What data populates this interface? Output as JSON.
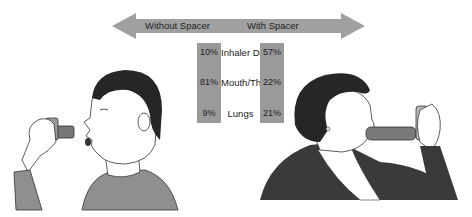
{
  "arrows": {
    "left_label": "Without Spacer",
    "right_label": "With Spacer",
    "color": "#a0a0a0"
  },
  "table": {
    "rows": [
      {
        "label": "Inhaler Device",
        "without_spacer": "10%",
        "with_spacer": "57%"
      },
      {
        "label": "Mouth/Throat",
        "without_spacer": "81%",
        "with_spacer": "22%"
      },
      {
        "label": "Lungs",
        "without_spacer": "9%",
        "with_spacer": "21%"
      }
    ],
    "bar_color": "#9a9a9a"
  },
  "illustrations": {
    "left": "boy using inhaler without spacer",
    "right": "woman using inhaler with spacer"
  }
}
